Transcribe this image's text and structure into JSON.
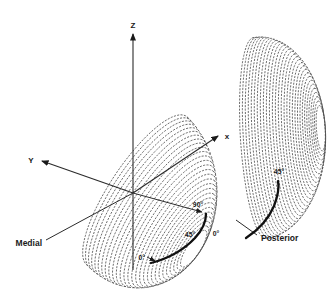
{
  "figure": {
    "background_color": "#ffffff",
    "mesh_line_color": "#474747",
    "axis_line_color": "#2b2b2b",
    "highlight_arc_color": "#101010",
    "axes": {
      "z": "Z",
      "y": "Y",
      "x": "x"
    },
    "anatomical_labels": {
      "medial": "Medial",
      "posterior": "Posterior"
    },
    "angle_labels": {
      "left_scale": [
        "0°",
        "45°",
        "90°"
      ],
      "front_zero": "0°",
      "right_scale_end": "45°"
    }
  }
}
